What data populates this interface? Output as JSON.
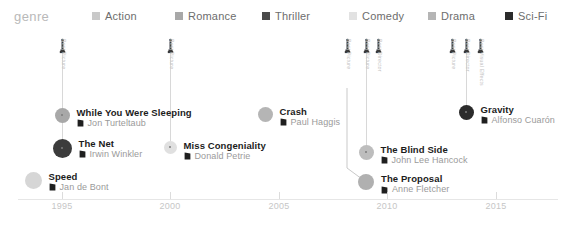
{
  "legend": {
    "title": "genre",
    "items": [
      {
        "label": "Action",
        "color": "#c9c9c9",
        "x": 92
      },
      {
        "label": "Romance",
        "color": "#a8a8a8",
        "x": 175
      },
      {
        "label": "Thriller",
        "color": "#4a4a4a",
        "x": 262
      },
      {
        "label": "Comedy",
        "color": "#e2e2e2",
        "x": 349
      },
      {
        "label": "Drama",
        "color": "#b5b5b5",
        "x": 428
      },
      {
        "label": "Sci-Fi",
        "color": "#2b2b2b",
        "x": 505
      }
    ]
  },
  "axis": {
    "ticks": [
      {
        "label": "1995",
        "x": 62
      },
      {
        "label": "2000",
        "x": 170
      },
      {
        "label": "2005",
        "x": 279
      },
      {
        "label": "2010",
        "x": 387
      },
      {
        "label": "2015",
        "x": 496
      }
    ]
  },
  "awards": [
    {
      "name": "oscar-1995",
      "x": 62,
      "y": 38,
      "labels": [
        "Best Picture"
      ],
      "count": 1
    },
    {
      "name": "oscar-2000",
      "x": 170,
      "y": 38,
      "labels": [
        "Best Picture"
      ],
      "count": 1
    },
    {
      "name": "oscar-2009a",
      "x": 347,
      "y": 38,
      "labels": [
        "Best Picture"
      ],
      "count": 1
    },
    {
      "name": "oscar-2009b",
      "x": 366,
      "y": 38,
      "labels": [
        "Best Picture"
      ],
      "count": 1
    },
    {
      "name": "oscar-2009c",
      "x": 378,
      "y": 38,
      "labels": [
        "Best Director"
      ],
      "count": 1
    },
    {
      "name": "oscar-2013a",
      "x": 452,
      "y": 38,
      "labels": [
        "Best Picture"
      ],
      "count": 1
    },
    {
      "name": "oscar-2013b",
      "x": 466,
      "y": 38,
      "labels": [
        "Best Director"
      ],
      "count": 1
    },
    {
      "name": "oscar-2013c",
      "x": 480,
      "y": 38,
      "labels": [
        "Best Visual Effects"
      ],
      "count": 1
    }
  ],
  "films": [
    {
      "title": "While You Were Sleeping",
      "director": "Jon Turteltaub",
      "genre": "Romance",
      "color": "#a8a8a8",
      "dot": 15,
      "cx": 62,
      "cy": 115,
      "stem_top": 48
    },
    {
      "title": "The Net",
      "director": "Irwin Winkler",
      "genre": "Thriller",
      "color": "#3c3c3c",
      "dot": 19,
      "cx": 62,
      "cy": 148,
      "stem_top": 48
    },
    {
      "title": "Speed",
      "director": "Jan de Bont",
      "genre": "Action",
      "color": "#d6d6d6",
      "dot": 17,
      "cx": 33,
      "cy": 180,
      "stem_top": 0
    },
    {
      "title": "Miss Congeniality",
      "director": "Donald Petrie",
      "genre": "Comedy",
      "color": "#e0e0e0",
      "dot": 13,
      "cx": 170,
      "cy": 147,
      "stem_top": 48
    },
    {
      "title": "Crash",
      "director": "Paul Haggis",
      "genre": "Drama",
      "color": "#b5b5b5",
      "dot": 15,
      "cx": 265,
      "cy": 114,
      "stem_top": 0
    },
    {
      "title": "The Blind Side",
      "director": "John Lee Hancock",
      "genre": "Drama",
      "color": "#bdbdbd",
      "dot": 15,
      "cx": 366,
      "cy": 152,
      "stem_top": 48
    },
    {
      "title": "The Proposal",
      "director": "Anne Fletcher",
      "genre": "Romance",
      "color": "#b0b0b0",
      "dot": 16,
      "cx": 366,
      "cy": 182,
      "stem_top": 0
    },
    {
      "title": "Gravity",
      "director": "Alfonso Cuarón",
      "genre": "Sci-Fi",
      "color": "#2b2b2b",
      "dot": 15,
      "cx": 466,
      "cy": 112,
      "stem_top": 48
    }
  ],
  "connector": {
    "name": "proposal-connector",
    "path": "M 347 88 L 347 168 L 366 182"
  },
  "chart_data": {
    "type": "scatter",
    "title": "",
    "xlabel": "",
    "ylabel": "",
    "xlim": [
      1993,
      2016
    ],
    "grid": false,
    "legend_position": "top",
    "categories": [
      "Action",
      "Romance",
      "Thriller",
      "Comedy",
      "Drama",
      "Sci-Fi"
    ],
    "points": [
      {
        "title": "While You Were Sleeping",
        "director": "Jon Turteltaub",
        "year": 1995,
        "genre": "Romance"
      },
      {
        "title": "The Net",
        "director": "Irwin Winkler",
        "year": 1995,
        "genre": "Thriller"
      },
      {
        "title": "Speed",
        "director": "Jan de Bont",
        "year": 1994,
        "genre": "Action"
      },
      {
        "title": "Miss Congeniality",
        "director": "Donald Petrie",
        "year": 2000,
        "genre": "Comedy"
      },
      {
        "title": "Crash",
        "director": "Paul Haggis",
        "year": 2004,
        "genre": "Drama"
      },
      {
        "title": "The Blind Side",
        "director": "John Lee Hancock",
        "year": 2009,
        "genre": "Drama"
      },
      {
        "title": "The Proposal",
        "director": "Anne Fletcher",
        "year": 2009,
        "genre": "Romance"
      },
      {
        "title": "Gravity",
        "director": "Alfonso Cuarón",
        "year": 2013,
        "genre": "Sci-Fi"
      }
    ]
  }
}
